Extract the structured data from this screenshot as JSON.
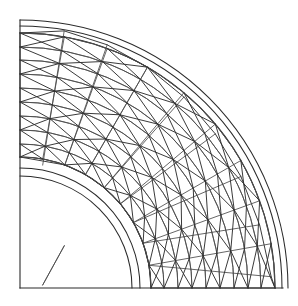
{
  "figure": {
    "type": "mesh-diagram",
    "background_color": "#ffffff",
    "line_color": "#3a3a3a",
    "boundary_color": "#2a2a2a",
    "caption": ""
  },
  "geometry": {
    "center_x": 20,
    "center_y": 288,
    "frame": {
      "left": 20,
      "top": 20,
      "right": 283,
      "bottom": 288,
      "width": 263,
      "height": 268
    },
    "angle_start_deg": 0,
    "angle_end_deg": 90,
    "inner_radius": 118,
    "outer_radius": 264,
    "inner_boundary_radii": [
      112,
      120,
      131
    ],
    "outer_boundary_radii": [
      255,
      262,
      268
    ],
    "radial_divisions": 9,
    "circumferential_divisions": 9,
    "mesh_inner_radius": 131,
    "mesh_outer_radius": 255
  },
  "chart_data": {
    "type": "mesh",
    "radial_rings": [
      131,
      144,
      158,
      172,
      186,
      200,
      214,
      228,
      241,
      255
    ],
    "angular_lines_deg": [
      0,
      10,
      20,
      30,
      40,
      50,
      60,
      70,
      80,
      90
    ],
    "element_count": 81,
    "node_count": 100,
    "xlabel": "",
    "ylabel": "",
    "grid": false,
    "legend": "none"
  },
  "labels": {
    "none": ""
  }
}
